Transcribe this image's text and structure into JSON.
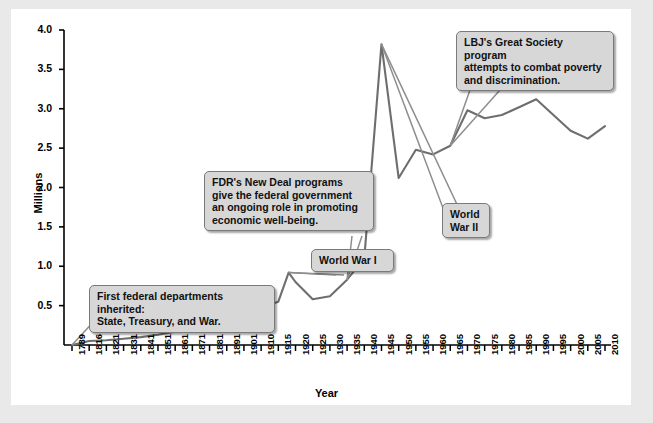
{
  "chart_data": {
    "type": "line",
    "title": "",
    "xlabel": "Year",
    "ylabel": "Millions",
    "ylim": [
      0.0,
      4.0
    ],
    "yticks": [
      "0.5",
      "1.0",
      "1.5",
      "2.0",
      "2.5",
      "3.0",
      "3.5",
      "4.0"
    ],
    "ytick_values": [
      0.5,
      1.0,
      1.5,
      2.0,
      2.5,
      3.0,
      3.5,
      4.0
    ],
    "grid": false,
    "legend": "none",
    "xtick_labels": [
      "1789",
      "1816",
      "1821",
      "1831",
      "1841",
      "1851",
      "1861",
      "1871",
      "1881",
      "1891",
      "1901",
      "1910",
      "1915",
      "1920",
      "1925",
      "1930",
      "1935",
      "1940",
      "1945",
      "1950",
      "1955",
      "1960",
      "1965",
      "1970",
      "1975",
      "1980",
      "1985",
      "1990",
      "1995",
      "2000",
      "2005",
      "2010"
    ],
    "series": [
      {
        "name": "Federal civilian employment",
        "color": "#6e6e6e",
        "x": [
          1789,
          1816,
          1821,
          1831,
          1841,
          1851,
          1861,
          1871,
          1881,
          1891,
          1901,
          1910,
          1915,
          1918,
          1920,
          1925,
          1930,
          1935,
          1940,
          1945,
          1950,
          1955,
          1960,
          1965,
          1970,
          1975,
          1980,
          1985,
          1990,
          1995,
          2000,
          2005,
          2010
        ],
        "values": [
          0.0,
          0.05,
          0.06,
          0.08,
          0.1,
          0.13,
          0.17,
          0.21,
          0.26,
          0.32,
          0.41,
          0.48,
          0.55,
          0.92,
          0.8,
          0.58,
          0.62,
          0.83,
          1.1,
          3.82,
          2.12,
          2.48,
          2.42,
          2.53,
          2.98,
          2.88,
          2.92,
          3.02,
          3.12,
          2.92,
          2.72,
          2.62,
          2.78
        ]
      }
    ],
    "annotations": [
      {
        "id": "first-departments",
        "text": "First federal departments inherited:\nState, Treasury, and War.",
        "target_year": 1789,
        "target_value": 0.0
      },
      {
        "id": "fdr-new-deal",
        "text": "FDR's New Deal programs\ngive the federal government\nan ongoing role in promoting\neconomic well-being.",
        "target_year": 1935,
        "target_value": 0.83
      },
      {
        "id": "world-war-1",
        "text": "World War I",
        "target_year": 1918,
        "target_value": 0.92
      },
      {
        "id": "world-war-2",
        "text": "World\nWar II",
        "target_year": 1945,
        "target_value": 3.82
      },
      {
        "id": "lbj-great-society",
        "text": "LBJ's Great Society program\nattempts to combat poverty\nand discrimination.",
        "target_year": 1965,
        "target_value": 2.53
      }
    ]
  },
  "colors": {
    "page_background": "#e9e9e9",
    "panel_background": "#ffffff",
    "line": "#6e6e6e",
    "axis": "#000000",
    "callout_fill": "#d7d7d7",
    "callout_border": "#7a7a7a",
    "text": "#111111"
  }
}
